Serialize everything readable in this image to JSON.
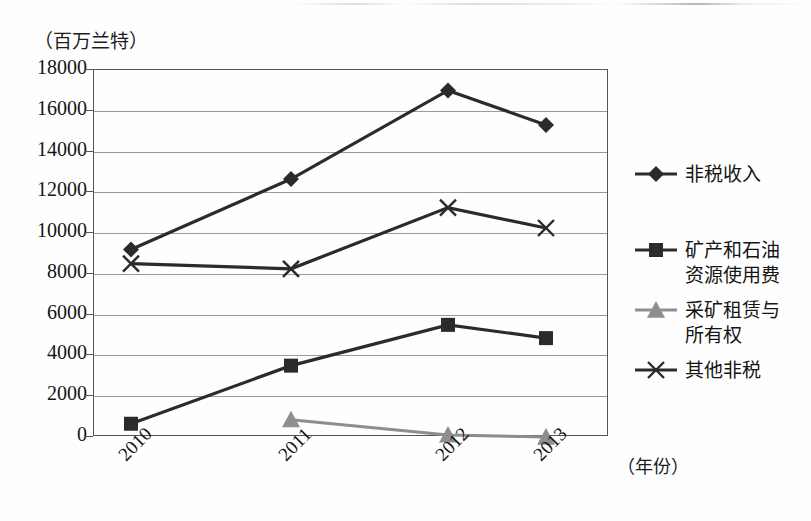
{
  "chart_data": {
    "type": "line",
    "title": "",
    "subtitle": "",
    "xlabel": "（年份）",
    "ylabel": "（百万兰特）",
    "x": [
      "2010",
      "2011",
      "2012",
      "2013"
    ],
    "categories": [
      "2010",
      "2011",
      "2012",
      "2013"
    ],
    "ylim": [
      0,
      18000
    ],
    "ytick_labels": [
      "18000",
      "16000",
      "14000",
      "12000",
      "10000",
      "8000",
      "6000",
      "4000",
      "2000",
      "0"
    ],
    "ytick_values": [
      18000,
      16000,
      14000,
      12000,
      10000,
      8000,
      6000,
      4000,
      2000,
      0
    ],
    "grid": true,
    "legend_position": "right",
    "series": [
      {
        "name": "非税收入",
        "marker": "diamond",
        "color": "#2b2b2b",
        "values": [
          9200,
          12650,
          17000,
          15300
        ]
      },
      {
        "name": "矿产和石油\n资源使用费",
        "marker": "square",
        "color": "#2b2b2b",
        "values": [
          650,
          3500,
          5500,
          4850
        ]
      },
      {
        "name": "采矿租赁与\n所有权",
        "marker": "triangle",
        "color": "#8d8d92",
        "values": [
          null,
          850,
          100,
          0
        ]
      },
      {
        "name": "其他非税",
        "marker": "x",
        "color": "#2b2b2b",
        "values": [
          8500,
          8250,
          11250,
          10250
        ]
      }
    ]
  },
  "axis": {
    "unit_label": "（百万兰特）",
    "x_axis_label": "（年份）"
  },
  "legend": {
    "items": [
      {
        "label": "非税收入",
        "marker": "diamond-marker",
        "color": "#2b2b2b"
      },
      {
        "label": "矿产和石油\n资源使用费",
        "marker": "square-marker",
        "color": "#2b2b2b"
      },
      {
        "label": "采矿租赁与\n所有权",
        "marker": "triangle-marker",
        "color": "#8d8d92"
      },
      {
        "label": "其他非税",
        "marker": "x-marker",
        "color": "#2b2b2b"
      }
    ]
  }
}
